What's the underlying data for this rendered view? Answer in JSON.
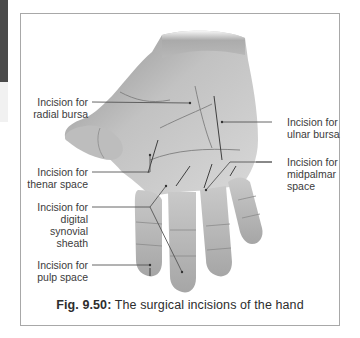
{
  "figure": {
    "caption_number": "Fig. 9.50:",
    "caption_text": "The surgical incisions of the hand",
    "labels": {
      "radial_bursa": [
        "Incision for",
        "radial bursa"
      ],
      "ulnar_bursa": [
        "Incision for",
        "ulnar bursa"
      ],
      "thenar_space": [
        "Incision for",
        "thenar space"
      ],
      "midpalmar_space": [
        "Incision for",
        "midpalmar",
        "space"
      ],
      "digital_synovial_sheath": [
        "Incision for",
        "digital synovial",
        "sheath"
      ],
      "pulp_space": [
        "Incision for",
        "pulp space"
      ]
    },
    "colors": {
      "frame": "#a8a8a8",
      "text": "#3b3b3b",
      "leader_line": "#555555",
      "skin_dark": "#9a9a9a",
      "skin_light": "#dcdcdc"
    }
  }
}
